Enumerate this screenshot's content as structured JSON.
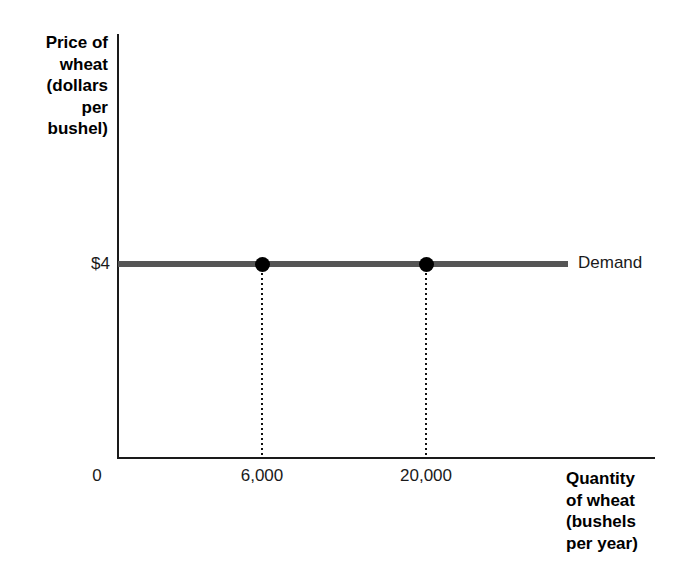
{
  "chart_data": {
    "type": "line",
    "title": "",
    "subtitle": "",
    "xlabel": "Quantity of wheat (bushels per year)",
    "ylabel": "Price of wheat (dollars per bushel)",
    "ylabel_lines": "Price of\nwheat\n(dollars\nper\nbushel)",
    "xlabel_lines": "Quantity\nof wheat\n(bushels\nper year)",
    "grid": false,
    "legend_position": "right-of-line",
    "x_tick_labels": [
      "0",
      "6,000",
      "20,000"
    ],
    "x_tick_values": [
      0,
      6000,
      20000
    ],
    "y_tick_labels": [
      "$4"
    ],
    "y_tick_values": [
      4
    ],
    "series": [
      {
        "name": "Demand",
        "label": "Demand",
        "color": "#555555",
        "shape": "horizontal",
        "y_value": 4,
        "x_start": 0,
        "x_end": 46000,
        "points": [
          {
            "x": 6000,
            "y": 4,
            "x_label": "6,000",
            "y_label": "$4"
          },
          {
            "x": 20000,
            "y": 4,
            "x_label": "20,000",
            "y_label": "$4"
          }
        ]
      }
    ],
    "annotations": [
      {
        "text": "Demand",
        "position": "right end of demand line"
      }
    ],
    "colors": {
      "axis": "#1a1a1a",
      "demand_line": "#555555",
      "data_point": "#000000",
      "drop_line": "#111111",
      "text": "#000000",
      "background": "#ffffff"
    }
  },
  "axes": {
    "y_title": "Price of\nwheat\n(dollars\nper\nbushel)",
    "x_title": "Quantity\nof wheat\n(bushels\nper year)"
  },
  "ticks": {
    "y": {
      "price_4": "$4"
    },
    "x": {
      "origin": "0",
      "q1": "6,000",
      "q2": "20,000"
    }
  },
  "legend": {
    "demand": "Demand"
  }
}
